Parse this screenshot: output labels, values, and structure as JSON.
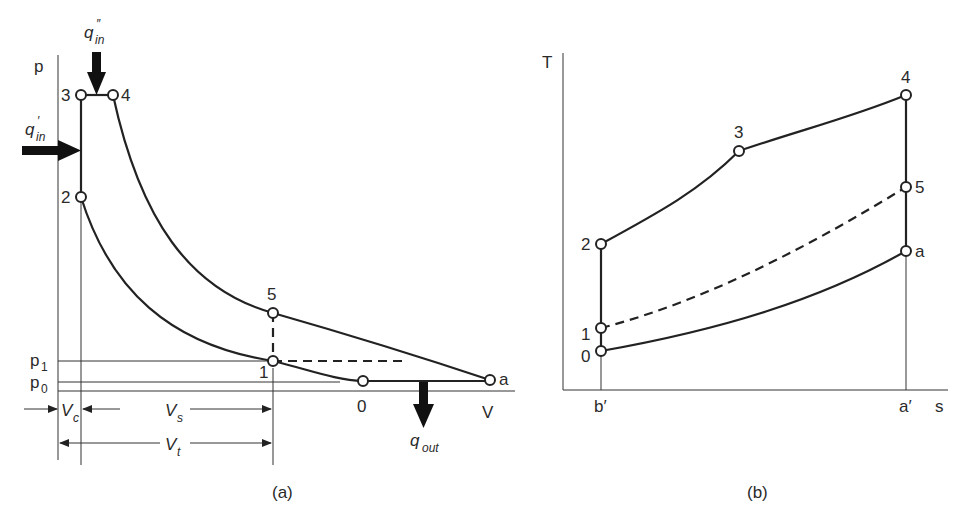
{
  "diagram_a": {
    "caption": "(a)",
    "y_axis_label": "p",
    "x_axis_label": "V",
    "pressure_labels": {
      "p1": "p",
      "p1_sub": "1",
      "p0": "p",
      "p0_sub": "0"
    },
    "points": {
      "p3": "3",
      "p4": "4",
      "p2": "2",
      "p5": "5",
      "p1": "1",
      "p0": "0",
      "pa": "a"
    },
    "heat": {
      "q_in_double": {
        "main": "q",
        "sub": "in",
        "prime": "″"
      },
      "q_in_single": {
        "main": "q",
        "sub": "in",
        "prime": "′"
      },
      "q_out": {
        "main": "q",
        "sub": "out"
      }
    },
    "volumes": {
      "vc": {
        "main": "V",
        "sub": "c"
      },
      "vs": {
        "main": "V",
        "sub": "s"
      },
      "vt": {
        "main": "V",
        "sub": "t"
      }
    }
  },
  "diagram_b": {
    "caption": "(b)",
    "y_axis_label": "T",
    "x_axis_label": "s",
    "tick_labels": {
      "b_prime": "b′",
      "a_prime": "a′"
    },
    "points": {
      "p4": "4",
      "p3": "3",
      "p5": "5",
      "p2": "2",
      "pa": "a",
      "p1": "1",
      "p0": "0"
    }
  },
  "colors": {
    "ink": "#222222",
    "background": "#ffffff"
  }
}
